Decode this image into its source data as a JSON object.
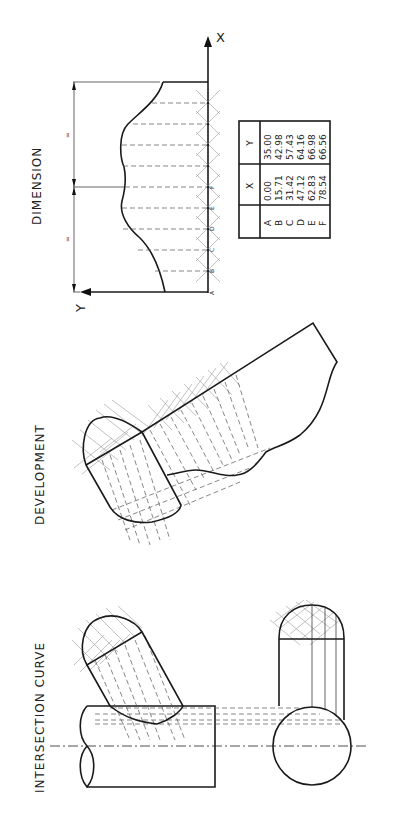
{
  "titles": {
    "dimension": "DIMENSION",
    "development": "DEVELOPMENT",
    "intersection": "INTERSECTION  CURVE"
  },
  "axes": {
    "x_label": "X",
    "y_label": "Y"
  },
  "dimension_marks": {
    "upper": "=",
    "lower": "="
  },
  "points": [
    "A",
    "B",
    "C",
    "D",
    "E",
    "F"
  ],
  "table": {
    "headers": [
      "",
      "X",
      "Y"
    ],
    "rows": [
      {
        "pt": "A",
        "x": "0.00",
        "y": "35.00"
      },
      {
        "pt": "B",
        "x": "15.71",
        "y": "42.98"
      },
      {
        "pt": "C",
        "x": "31.42",
        "y": "57.43"
      },
      {
        "pt": "D",
        "x": "47.12",
        "y": "64.16"
      },
      {
        "pt": "E",
        "x": "62.83",
        "y": "66.98"
      },
      {
        "pt": "F",
        "x": "78.54",
        "y": "66.56"
      }
    ]
  },
  "colors": {
    "line": "#1a1a1a",
    "construction": "#999999",
    "background": "#ffffff"
  }
}
